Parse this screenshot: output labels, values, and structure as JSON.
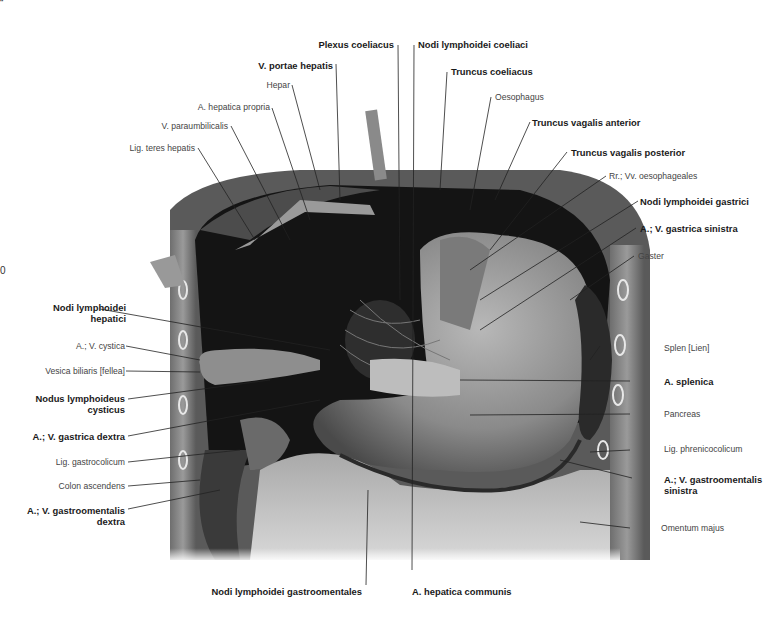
{
  "figure": {
    "edge_marks": {
      "top_left": "“",
      "left_mid": "0"
    },
    "labels_top": [
      {
        "id": "plexus-coeliacus",
        "text": "Plexus coeliacus",
        "bold": true
      },
      {
        "id": "nodi-lymphoidei-coeliaci",
        "text": "Nodi lymphoidei coeliaci",
        "bold": true
      },
      {
        "id": "v-portae-hepatis",
        "text": "V. portae hepatis",
        "bold": true
      },
      {
        "id": "truncus-coeliacus",
        "text": "Truncus coeliacus",
        "bold": true
      },
      {
        "id": "hepar",
        "text": "Hepar",
        "bold": false
      },
      {
        "id": "oesophagus",
        "text": "Oesophagus",
        "bold": false
      },
      {
        "id": "a-hepatica-propria",
        "text": "A. hepatica propria",
        "bold": false
      },
      {
        "id": "truncus-vagalis-anterior",
        "text": "Truncus vagalis anterior",
        "bold": true
      },
      {
        "id": "v-paraumbilicalis",
        "text": "V. paraumbilicalis",
        "bold": false
      },
      {
        "id": "lig-teres-hepatis",
        "text": "Lig. teres hepatis",
        "bold": false
      },
      {
        "id": "truncus-vagalis-posterior",
        "text": "Truncus vagalis posterior",
        "bold": true
      }
    ],
    "labels_right": [
      {
        "id": "rr-vv-oesophageales",
        "text": "Rr.; Vv. oesophageales",
        "bold": false
      },
      {
        "id": "nodi-lymphoidei-gastrici",
        "text": "Nodi lymphoidei gastrici",
        "bold": true
      },
      {
        "id": "a-v-gastrica-sinistra",
        "text": "A.; V. gastrica sinistra",
        "bold": true
      },
      {
        "id": "gaster",
        "text": "Gaster",
        "bold": false
      },
      {
        "id": "splen",
        "text": "Splen [Lien]",
        "bold": false
      },
      {
        "id": "a-splenica",
        "text": "A. splenica",
        "bold": true
      },
      {
        "id": "pancreas",
        "text": "Pancreas",
        "bold": false
      },
      {
        "id": "lig-phrenicocolicum",
        "text": "Lig. phrenicocolicum",
        "bold": false
      },
      {
        "id": "a-v-gastroomentalis-sinistra",
        "text": "A.; V. gastroomentalis",
        "text2": "sinistra",
        "bold": true
      },
      {
        "id": "omentum-majus",
        "text": "Omentum majus",
        "bold": false
      }
    ],
    "labels_left": [
      {
        "id": "nodi-lymphoidei-hepatici",
        "text": "Nodi lymphoidei",
        "text2": "hepatici",
        "bold": true
      },
      {
        "id": "a-v-cystica",
        "text": "A.; V. cystica",
        "bold": false
      },
      {
        "id": "vesica-biliaris",
        "text": "Vesica biliaris [fellea]",
        "bold": false
      },
      {
        "id": "nodus-lymphoideus-cysticus",
        "text": "Nodus lymphoideus",
        "text2": "cysticus",
        "bold": true
      },
      {
        "id": "a-v-gastrica-dextra",
        "text": "A.; V. gastrica dextra",
        "bold": true
      },
      {
        "id": "lig-gastrocolicum",
        "text": "Lig. gastrocolicum",
        "bold": false
      },
      {
        "id": "colon-ascendens",
        "text": "Colon ascendens",
        "bold": false
      },
      {
        "id": "a-v-gastroomentalis-dextra",
        "text": "A.; V. gastroomentalis",
        "text2": "dextra",
        "bold": true
      }
    ],
    "labels_bottom": [
      {
        "id": "nodi-lymphoidei-gastroomentales",
        "text": "Nodi lymphoidei gastroomentales",
        "bold": true
      },
      {
        "id": "a-hepatica-communis",
        "text": "A. hepatica communis",
        "bold": true
      }
    ]
  }
}
